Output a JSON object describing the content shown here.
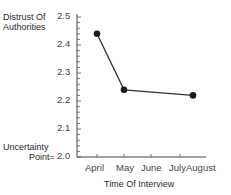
{
  "chart_data": {
    "type": "line",
    "title": "",
    "ylabel": "Distrust Of Authorities",
    "xlabel": "Time Of Interview",
    "y_bottom_label": "Uncertainty Point= 2.0",
    "ylim": [
      2.0,
      2.5
    ],
    "y_ticks": [
      "2.5",
      "2.4",
      "2.3",
      "2.2",
      "2.1",
      "2.0"
    ],
    "x_tick_labels": [
      "April",
      "May",
      "June",
      "July",
      "August"
    ],
    "grid": false,
    "legend": null,
    "series": [
      {
        "name": "Distrust Of Authorities",
        "x": [
          "April",
          "May",
          "July-August"
        ],
        "values": [
          2.44,
          2.24,
          2.22
        ]
      }
    ]
  },
  "labels": {
    "ylabel_line1": "Distrust Of",
    "ylabel_line2": "Authorities",
    "uncertainty_line1": "Uncertainty",
    "uncertainty_line2": "Point=",
    "xlabel": "Time Of Interview"
  }
}
